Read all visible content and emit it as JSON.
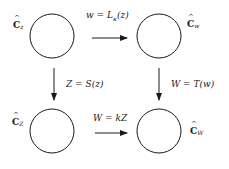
{
  "diagram": {
    "type": "commutative-diagram",
    "nodes": [
      {
        "id": "Cz",
        "base": "C",
        "subscript": "z",
        "position": "top-left"
      },
      {
        "id": "Cw",
        "base": "C",
        "subscript": "w",
        "position": "top-right"
      },
      {
        "id": "CZ",
        "base": "C",
        "subscript": "Z",
        "position": "bottom-left"
      },
      {
        "id": "CW",
        "base": "C",
        "subscript": "W",
        "position": "bottom-right"
      }
    ],
    "edges": [
      {
        "from": "Cz",
        "to": "Cw",
        "label": "w = Lκ(z)",
        "direction": "right"
      },
      {
        "from": "Cz",
        "to": "CZ",
        "label": "Z = S(z)",
        "direction": "down"
      },
      {
        "from": "Cw",
        "to": "CW",
        "label": "W = T(w)",
        "direction": "down"
      },
      {
        "from": "CZ",
        "to": "CW",
        "label": "W = kZ",
        "direction": "right"
      }
    ]
  },
  "labels": {
    "top_arrow": {
      "lhs": "w = L",
      "sub": "κ",
      "rhs": "(z)"
    },
    "left_arrow": "Z = S(z)",
    "right_arrow": "W = T(w)",
    "bottom_arrow": "W = kZ",
    "node_Cz": {
      "base": "C",
      "sub": "z"
    },
    "node_Cw": {
      "base": "C",
      "sub": "w"
    },
    "node_CZ": {
      "base": "C",
      "sub": "Z"
    },
    "node_CW": {
      "base": "C",
      "sub": "W"
    }
  },
  "colors": {
    "stroke": "#1a1a1a",
    "background": "#ffffff"
  }
}
